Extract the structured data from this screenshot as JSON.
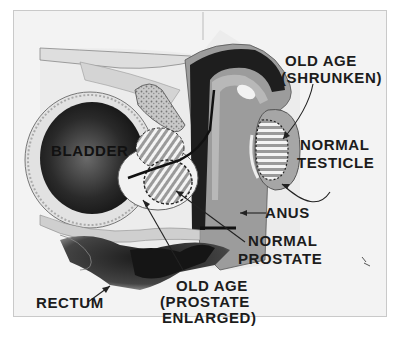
{
  "diagram": {
    "type": "anatomical cross-section",
    "labels": {
      "bladder": "BLADDER",
      "old_age_shrunken_line1": "OLD AGE",
      "old_age_shrunken_line2": "(SHRUNKEN)",
      "normal_testicle_line1": "NORMAL",
      "normal_testicle_line2": "TESTICLE",
      "anus": "ANUS",
      "normal_prostate_line1": "NORMAL",
      "normal_prostate_line2": "PROSTATE",
      "old_age_prostate_line1": "OLD AGE",
      "old_age_prostate_line2": "(PROSTATE",
      "old_age_prostate_line3": "ENLARGED)",
      "rectum": "RECTUM"
    },
    "colors": {
      "background": "#f3f3f3",
      "dark_tissue": "#1e1e1e",
      "mid_tissue": "#8f8f8f",
      "light_tissue": "#c4c4c4",
      "label_text": "#1c1c1c"
    }
  }
}
